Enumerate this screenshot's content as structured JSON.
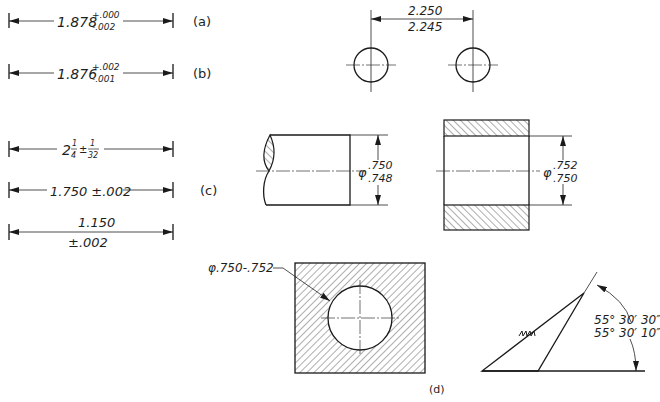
{
  "figure": {
    "labels": {
      "a": "(a)",
      "b": "(b)",
      "c": "(c)",
      "d": "(d)"
    },
    "colors": {
      "ink": "#1a1a1a",
      "background": "#ffffff"
    }
  },
  "dim_a": {
    "value": "1.878",
    "upper_tol": "+.000",
    "lower_tol": "-.002"
  },
  "dim_b": {
    "value": "1.876",
    "upper_tol": "+.002",
    "lower_tol": "-.001"
  },
  "dim_c": [
    {
      "whole": "2",
      "frac_num": "1",
      "frac_den": "4",
      "tol_sign": "±",
      "tol_num": "1",
      "tol_den": "32"
    },
    {
      "text": "1.750 ±.002"
    },
    {
      "value": "1.150",
      "tol": "±.002"
    }
  ],
  "holes": {
    "upper": "2.250",
    "lower": "2.245"
  },
  "shaft": {
    "symbol": "φ",
    "upper": ".750",
    "lower": ".748"
  },
  "bushing": {
    "symbol": "φ",
    "upper": ".752",
    "lower": ".750"
  },
  "plate": {
    "leader_text": "φ.750-.752"
  },
  "angle": {
    "upper": "55° 30′ 30″",
    "lower": "55° 30′ 10″"
  }
}
